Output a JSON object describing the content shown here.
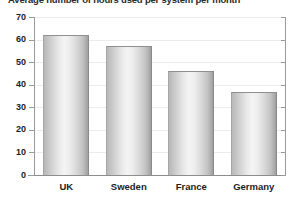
{
  "chart_data": {
    "type": "bar",
    "title": "Average number of hours used per system per month",
    "xlabel": "",
    "ylabel": "",
    "categories": [
      "UK",
      "Sweden",
      "France",
      "Germany"
    ],
    "values": [
      62,
      57,
      46,
      37
    ],
    "ylim": [
      0,
      70
    ],
    "yticks": [
      0,
      10,
      20,
      30,
      40,
      50,
      60,
      70
    ],
    "ytick_labels": [
      "0",
      "10",
      "20",
      "30",
      "40",
      "50",
      "60",
      "70"
    ],
    "grid": true,
    "legend": null,
    "bar_color": "#dcdcdc",
    "bar_edge_color": "#8f8f8f",
    "axis_color": "#9a9a9a",
    "text_color": "#1d1d1d",
    "background_color": "#ffffff"
  }
}
